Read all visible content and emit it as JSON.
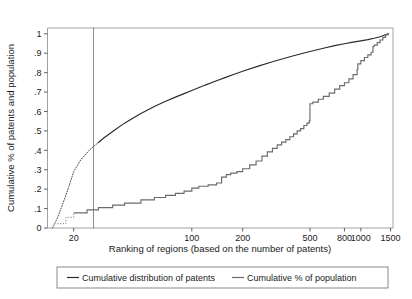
{
  "chart_data": {
    "type": "line",
    "title": "",
    "subtitle": "",
    "xlabel": "Ranking of regions (based on the number of patents)",
    "ylabel": "Cumulative % of patents and population",
    "xscale": "log",
    "yscale": "linear",
    "xlim": [
      14,
      1550
    ],
    "ylim": [
      0,
      1.03
    ],
    "grid": false,
    "legend_position": "below-axes",
    "x_tick_labels": [
      "20",
      "100",
      "200",
      "500",
      "800",
      "1000",
      "1500"
    ],
    "x_ticks": [
      20,
      100,
      200,
      500,
      800,
      1000,
      1500
    ],
    "y_tick_labels": [
      "0",
      ".1",
      ".2",
      ".3",
      ".4",
      ".5",
      ".6",
      ".7",
      ".8",
      ".9",
      "1"
    ],
    "y_ticks": [
      0,
      0.1,
      0.2,
      0.3,
      0.4,
      0.5,
      0.6,
      0.7,
      0.8,
      0.9,
      1
    ],
    "annotations": [
      {
        "type": "vertical-reference-line",
        "x": 100,
        "label": ""
      }
    ],
    "series": [
      {
        "name": "Cumulative distribution of patents",
        "color": "#2b2b2b",
        "style": "solid",
        "x": [
          15,
          16,
          17,
          18,
          19,
          20,
          22,
          25,
          28,
          30,
          35,
          40,
          45,
          50,
          60,
          70,
          80,
          90,
          100,
          120,
          140,
          160,
          180,
          200,
          250,
          300,
          350,
          400,
          450,
          500,
          600,
          700,
          800,
          900,
          1000,
          1100,
          1200,
          1300,
          1400,
          1450
        ],
        "y": [
          0.0,
          0.05,
          0.11,
          0.17,
          0.23,
          0.29,
          0.35,
          0.405,
          0.44,
          0.462,
          0.505,
          0.54,
          0.567,
          0.59,
          0.626,
          0.653,
          0.674,
          0.692,
          0.708,
          0.736,
          0.758,
          0.777,
          0.793,
          0.807,
          0.835,
          0.856,
          0.873,
          0.887,
          0.899,
          0.909,
          0.926,
          0.939,
          0.949,
          0.957,
          0.964,
          0.97,
          0.977,
          0.985,
          0.995,
          1.0
        ]
      },
      {
        "name": "Cumulative % of population",
        "color": "#6b6b6b",
        "style": "stepped",
        "x": [
          16,
          18,
          20,
          24,
          28,
          34,
          40,
          50,
          60,
          70,
          80,
          90,
          100,
          110,
          125,
          140,
          150,
          160,
          170,
          185,
          200,
          220,
          240,
          260,
          280,
          300,
          320,
          340,
          360,
          380,
          400,
          420,
          440,
          460,
          480,
          495,
          500,
          520,
          560,
          600,
          650,
          700,
          750,
          800,
          850,
          900,
          950,
          960,
          1000,
          1050,
          1100,
          1150,
          1180,
          1200,
          1250,
          1300,
          1350,
          1400,
          1450
        ],
        "y": [
          0.022,
          0.055,
          0.078,
          0.093,
          0.105,
          0.118,
          0.128,
          0.145,
          0.157,
          0.168,
          0.178,
          0.19,
          0.205,
          0.215,
          0.222,
          0.232,
          0.262,
          0.275,
          0.283,
          0.29,
          0.305,
          0.325,
          0.345,
          0.37,
          0.392,
          0.41,
          0.428,
          0.442,
          0.455,
          0.47,
          0.485,
          0.5,
          0.512,
          0.528,
          0.54,
          0.552,
          0.64,
          0.648,
          0.663,
          0.678,
          0.695,
          0.715,
          0.733,
          0.748,
          0.768,
          0.79,
          0.815,
          0.845,
          0.862,
          0.878,
          0.892,
          0.905,
          0.935,
          0.942,
          0.955,
          0.968,
          0.982,
          0.994,
          1.005
        ]
      }
    ],
    "legend": [
      {
        "label": "Cumulative distribution of patents",
        "color": "#2b2b2b"
      },
      {
        "label": "Cumulative % of population",
        "color": "#6b6b6b"
      }
    ]
  }
}
